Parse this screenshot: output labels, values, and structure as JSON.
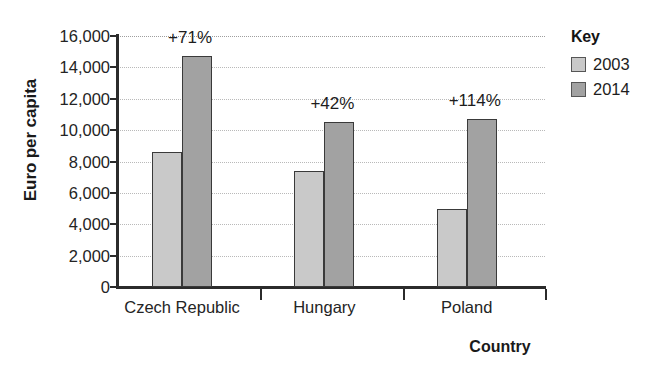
{
  "chart_data": {
    "type": "bar",
    "title": "",
    "subtitle": "",
    "xlabel": "Country",
    "ylabel": "Euro per capita",
    "categories": [
      "Czech Republic",
      "Hungary",
      "Poland"
    ],
    "series": [
      {
        "name": "2003",
        "color": "#c9c9c9",
        "values": [
          8600,
          7400,
          5000
        ]
      },
      {
        "name": "2014",
        "color": "#a2a2a2",
        "values": [
          14700,
          10500,
          10700
        ]
      }
    ],
    "annotations": [
      "+71%",
      "+42%",
      "+114%"
    ],
    "ylim": [
      0,
      16000
    ],
    "ytick_step": 2000,
    "ytick_labels": [
      "16,000",
      "14,000",
      "12,000",
      "10,000",
      "8,000",
      "6,000",
      "4,000",
      "2,000",
      "0"
    ],
    "ytick_values": [
      16000,
      14000,
      12000,
      10000,
      8000,
      6000,
      4000,
      2000,
      0
    ],
    "grid": true,
    "grid_axis": "y",
    "legend_position": "right",
    "legend_title": "Key"
  },
  "legend": {
    "title": "Key",
    "entries": [
      {
        "label": "2003",
        "color": "#c9c9c9"
      },
      {
        "label": "2014",
        "color": "#a2a2a2"
      }
    ]
  },
  "axes": {
    "y_title": "Euro per capita",
    "x_title": "Country"
  }
}
